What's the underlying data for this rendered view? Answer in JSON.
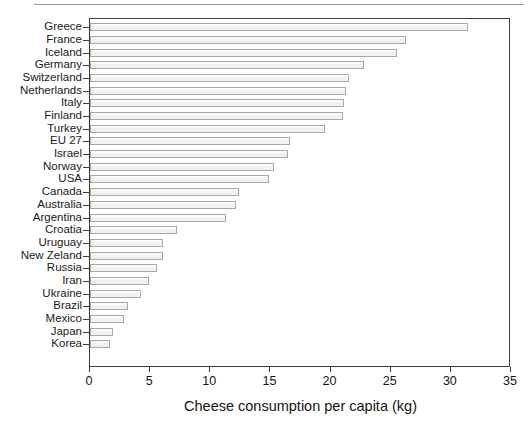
{
  "chart_data": {
    "type": "bar",
    "orientation": "horizontal",
    "title": "",
    "xlabel": "Cheese consumption per capita (kg)",
    "ylabel": "",
    "xlim": [
      0,
      35
    ],
    "xticks": [
      0,
      5,
      10,
      15,
      20,
      25,
      30,
      35
    ],
    "grid": false,
    "legend": false,
    "bar_fill_color": "#f1f1f1",
    "bar_edge_color": "#a8a8a8",
    "axis_color": "#3c3c3c",
    "categories": [
      "Greece",
      "France",
      "Iceland",
      "Germany",
      "Switzerland",
      "Netherlands",
      "Italy",
      "Finland",
      "Turkey",
      "EU 27",
      "Israel",
      "Norway",
      "USA",
      "Canada",
      "Australia",
      "Argentina",
      "Croatia",
      "Uruguay",
      "New Zeland",
      "Russia",
      "Iran",
      "Ukraine",
      "Brazil",
      "Mexico",
      "Japan",
      "Korea"
    ],
    "values": [
      31.4,
      26.3,
      25.5,
      22.8,
      21.5,
      21.3,
      21.1,
      21.0,
      19.5,
      16.6,
      16.5,
      15.3,
      14.9,
      12.4,
      12.1,
      11.3,
      7.2,
      6.1,
      6.1,
      5.6,
      4.9,
      4.2,
      3.2,
      2.8,
      1.9,
      1.7
    ]
  },
  "figure": {
    "top_rule": "horizontal-rule"
  }
}
